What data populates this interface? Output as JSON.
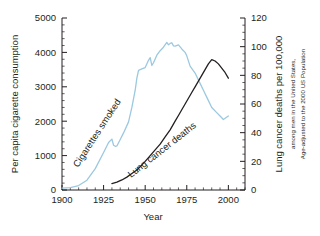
{
  "chart_data": {
    "type": "line",
    "title": "",
    "xlabel": "Year",
    "ylabel": "Per capita cigarette consumption",
    "y2label": "Lung cancer deaths per 100,000",
    "y2sublabel_1": "among men in the United States,",
    "y2sublabel_2": "Age-adjusted to the 2000 US Population",
    "xlim": [
      1900,
      2010
    ],
    "ylim": [
      0,
      5000
    ],
    "y2lim": [
      0,
      120
    ],
    "xticks": [
      1900,
      1925,
      1950,
      1975,
      2000
    ],
    "xtick_labels": [
      "1900",
      "1925",
      "1950",
      "1975",
      "2000"
    ],
    "xminor_step": 5,
    "yticks": [
      0,
      1000,
      2000,
      3000,
      4000,
      5000
    ],
    "ytick_labels": [
      "0",
      "1000",
      "2000",
      "3000",
      "4000",
      "5000"
    ],
    "yminor_step": 200,
    "y2ticks": [
      0,
      20,
      40,
      60,
      80,
      100,
      120
    ],
    "y2tick_labels": [
      "0",
      "20",
      "40",
      "60",
      "80",
      "100",
      "120"
    ],
    "y2minor_step": 5,
    "grid": false,
    "legend_position": "inline-annotations",
    "series": [
      {
        "name": "Cigarettes smoked",
        "axis": "left",
        "color": "#9cc8e0",
        "annotation": "Cigarettes smoked",
        "annotation_rotation_deg": -57,
        "x": [
          1900,
          1905,
          1910,
          1915,
          1920,
          1925,
          1928,
          1930,
          1931,
          1932,
          1933,
          1935,
          1937,
          1940,
          1942,
          1944,
          1945,
          1946,
          1948,
          1950,
          1952,
          1953,
          1954,
          1955,
          1957,
          1959,
          1961,
          1963,
          1964,
          1965,
          1966,
          1967,
          1968,
          1970,
          1972,
          1974,
          1975,
          1977,
          1980,
          1983,
          1985,
          1987,
          1990,
          1993,
          1995,
          1997,
          2000
        ],
        "y": [
          55,
          70,
          130,
          285,
          620,
          1090,
          1380,
          1480,
          1300,
          1270,
          1280,
          1470,
          1660,
          1980,
          2400,
          2900,
          3250,
          3480,
          3520,
          3560,
          3770,
          3850,
          3620,
          3700,
          3920,
          4050,
          4150,
          4290,
          4220,
          4260,
          4280,
          4190,
          4180,
          4220,
          4100,
          4000,
          3900,
          3600,
          3400,
          3100,
          2900,
          2700,
          2400,
          2250,
          2150,
          2050,
          2150
        ]
      },
      {
        "name": "Lung cancer deaths",
        "axis": "right",
        "color": "#231f20",
        "annotation": "Lung cancer deaths",
        "annotation_rotation_deg": -38,
        "x": [
          1930,
          1933,
          1936,
          1939,
          1942,
          1945,
          1948,
          1950,
          1953,
          1956,
          1959,
          1962,
          1965,
          1968,
          1970,
          1972,
          1974,
          1976,
          1978,
          1980,
          1982,
          1984,
          1986,
          1988,
          1990,
          1992,
          1994,
          1996,
          1998,
          2000
        ],
        "y": [
          4.5,
          5.5,
          7,
          9,
          11.5,
          14,
          17.5,
          20,
          24,
          28,
          32,
          37,
          42,
          48,
          52,
          56,
          60,
          64,
          68,
          72,
          76,
          80,
          84,
          88,
          91,
          90,
          88,
          85,
          82,
          78
        ]
      }
    ]
  },
  "axes": {
    "left_title": "Per capita cigarette consumption",
    "right_title": "Lung cancer deaths per 100,000",
    "right_sub1": "among men in the United States,",
    "right_sub2": "Age-adjusted to the 2000 US Population",
    "bottom_title": "Year"
  },
  "annotations": {
    "blue_label": "Cigarettes smoked",
    "black_label": "Lung cancer deaths"
  },
  "colors": {
    "cigarettes": "#9cc8e0",
    "lung_cancer": "#231f20",
    "axis": "#231f20",
    "background": "#ffffff"
  }
}
